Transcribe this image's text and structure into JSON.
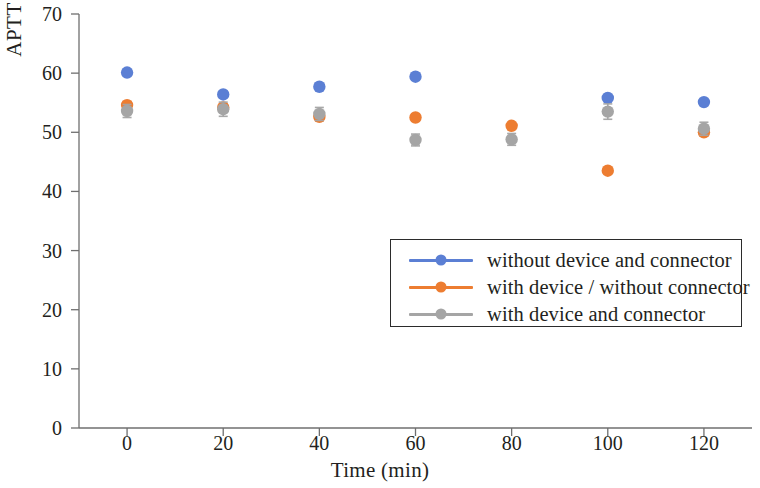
{
  "chart_data": {
    "type": "scatter",
    "title": "",
    "xlabel": "Time (min)",
    "ylabel": "APTT (s)",
    "x": [
      0,
      20,
      40,
      60,
      80,
      100,
      120
    ],
    "xtick_labels": [
      "0",
      "20",
      "40",
      "60",
      "80",
      "100",
      "120"
    ],
    "ytick_labels": [
      "0",
      "10",
      "20",
      "30",
      "40",
      "50",
      "60",
      "70"
    ],
    "xlim": [
      -10,
      130
    ],
    "ylim": [
      0,
      70
    ],
    "grid": false,
    "legend_position": "center-right",
    "series": [
      {
        "name": "without device and connector",
        "color": "#5B7FD4",
        "marker": "circle",
        "values": [
          60.1,
          56.4,
          57.7,
          59.4,
          null,
          55.8,
          55.1
        ],
        "errors": [
          0.0,
          0.0,
          0.0,
          0.0,
          null,
          0.0,
          0.0
        ]
      },
      {
        "name": "with device / without connector",
        "color": "#ED7D31",
        "marker": "circle",
        "values": [
          54.6,
          54.2,
          52.6,
          52.5,
          51.1,
          43.5,
          50.0
        ],
        "errors": [
          0.6,
          0.5,
          0.6,
          0.0,
          0.0,
          0.0,
          0.6
        ]
      },
      {
        "name": "with device and connector",
        "color": "#A5A5A5",
        "marker": "circle",
        "values": [
          53.6,
          53.9,
          53.1,
          48.7,
          48.8,
          53.5,
          50.6
        ],
        "errors": [
          1.1,
          1.2,
          1.1,
          1.0,
          1.0,
          1.3,
          1.1
        ]
      }
    ]
  },
  "axes": {
    "y_label": "APTT (s)",
    "x_label": "Time (min)"
  },
  "legend": {
    "items": [
      {
        "label": "without device and connector",
        "color": "#5B7FD4"
      },
      {
        "label": "with device / without connector",
        "color": "#ED7D31"
      },
      {
        "label": "with device and connector",
        "color": "#A5A5A5"
      }
    ]
  }
}
